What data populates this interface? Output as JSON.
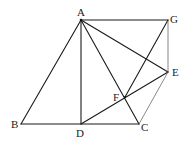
{
  "figure": {
    "type": "geometry",
    "points": [
      {
        "id": "A",
        "label": "A"
      },
      {
        "id": "B",
        "label": "B"
      },
      {
        "id": "C",
        "label": "C"
      },
      {
        "id": "D",
        "label": "D"
      },
      {
        "id": "E",
        "label": "E"
      },
      {
        "id": "F",
        "label": "F"
      },
      {
        "id": "G",
        "label": "G"
      }
    ],
    "segments": [
      {
        "from": "A",
        "to": "B",
        "style": "solid"
      },
      {
        "from": "B",
        "to": "C",
        "style": "solid"
      },
      {
        "from": "A",
        "to": "D",
        "style": "solid"
      },
      {
        "from": "A",
        "to": "C",
        "style": "solid"
      },
      {
        "from": "A",
        "to": "G",
        "style": "solid"
      },
      {
        "from": "A",
        "to": "E",
        "style": "solid"
      },
      {
        "from": "G",
        "to": "F",
        "style": "solid"
      },
      {
        "from": "D",
        "to": "E",
        "style": "solid"
      },
      {
        "from": "G",
        "to": "E",
        "style": "thin"
      },
      {
        "from": "E",
        "to": "C",
        "style": "thin"
      }
    ]
  }
}
